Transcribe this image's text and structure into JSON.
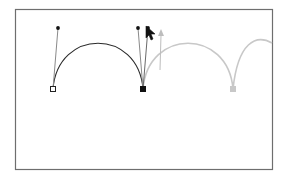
{
  "diagram": {
    "colors": {
      "frame": "#6e6e6e",
      "active_path": "#2a2a2a",
      "preview_path": "#c8c8c8",
      "handle_line": "#8a8a8a",
      "handle_point": "#111111",
      "preview_arrow": "#bdbdbd",
      "cursor": "#111111"
    },
    "frame": {
      "x": 15,
      "y": 9,
      "width": 258,
      "height": 161
    },
    "anchors": [
      {
        "name": "start-anchor",
        "x": 53,
        "y": 89,
        "style": "hollow"
      },
      {
        "name": "middle-anchor",
        "x": 143,
        "y": 89,
        "style": "filled"
      },
      {
        "name": "preview-anchor",
        "x": 233,
        "y": 89,
        "style": "preview"
      }
    ],
    "handles": [
      {
        "name": "start-handle",
        "from": [
          53,
          89
        ],
        "to": [
          58,
          28
        ]
      },
      {
        "name": "middle-handle-in",
        "from": [
          143,
          89
        ],
        "to": [
          138,
          28
        ]
      },
      {
        "name": "middle-handle-out",
        "from": [
          143,
          89
        ],
        "to": [
          148,
          28
        ]
      }
    ],
    "segments": [
      {
        "name": "active-arc",
        "path": "M53,89 C58,28 138,28 143,89",
        "style": "active"
      },
      {
        "name": "preview-arc-1",
        "path": "M143,89 C148,28 228,28 233,89",
        "style": "preview"
      },
      {
        "name": "preview-arc-2",
        "path": "M233,89 C238,40 258,30 273,43",
        "style": "preview"
      }
    ],
    "preview_arrow": {
      "from": [
        160,
        70
      ],
      "to": [
        161,
        32
      ]
    },
    "cursor": {
      "x": 146,
      "y": 26,
      "type": "arrow-pointer"
    }
  }
}
